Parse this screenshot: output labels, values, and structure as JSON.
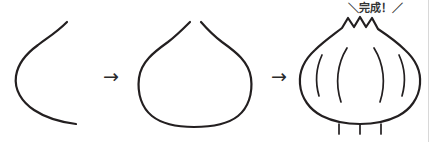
{
  "illustration": {
    "title": "Garlic bulb drawing steps",
    "background_color": "#ffffff",
    "ink_color": "#231f20",
    "border_color": "#d8d8d8",
    "step_separator_symbol": "→",
    "done_label": "＼完成！／",
    "steps": [
      {
        "index": 1,
        "name": "left-contour-stroke",
        "description": "single open curved stroke forming the left side of the bulb"
      },
      {
        "index": 2,
        "name": "closed-outline",
        "description": "symmetric closed bulb outline with a small gap at the top"
      },
      {
        "index": 3,
        "name": "finished-garlic",
        "description": "completed garlic bulb with zigzag top, four clove arcs and three roots",
        "clove_arc_count": 4,
        "root_count": 3,
        "top_peak_count": 3
      }
    ]
  }
}
